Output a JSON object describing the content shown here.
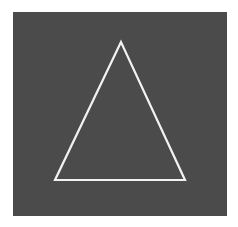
{
  "image": {
    "background_color": "#ffffff",
    "panel_color": "#4b4b4b",
    "shape": {
      "type": "triangle",
      "outline_color": "#f2f2f2",
      "fill": "none",
      "vertices": [
        [
          121,
          42
        ],
        [
          55,
          180
        ],
        [
          185,
          180
        ]
      ]
    }
  }
}
